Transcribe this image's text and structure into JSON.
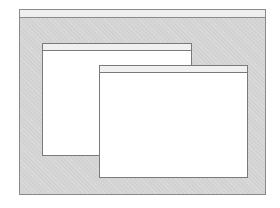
{
  "scene": {
    "description": "Illustration of a desktop screen with two overlapping blank windows",
    "colors": {
      "desktop_background": "#d2d2d2",
      "border": "#8a8a8a",
      "title_bar": "#f0f0f0",
      "window_body": "#ffffff"
    },
    "windows": [
      {
        "id": "back-window",
        "title": ""
      },
      {
        "id": "front-window",
        "title": ""
      }
    ]
  }
}
